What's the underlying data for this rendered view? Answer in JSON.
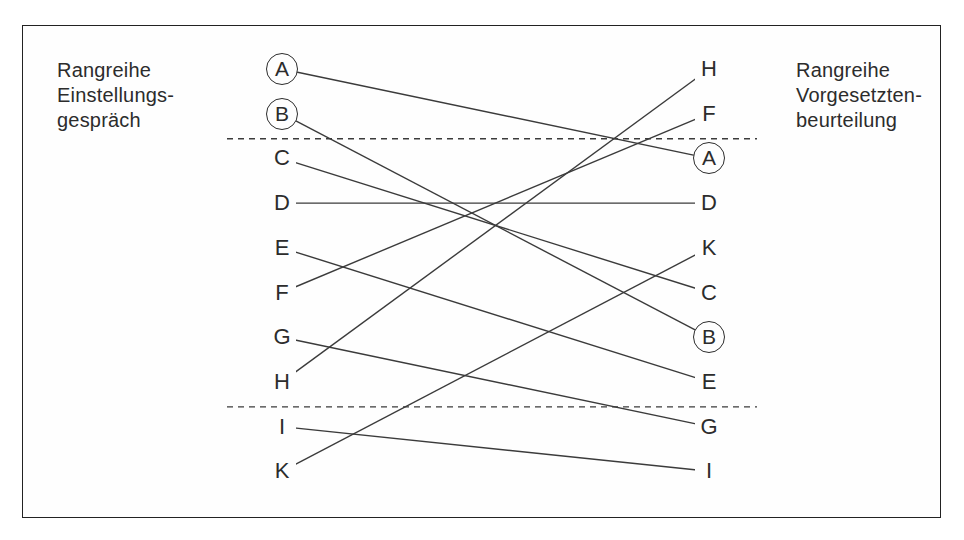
{
  "diagram": {
    "type": "rank-comparison",
    "left": {
      "title": "Rangreihe\nEinstellungs-\ngespräch",
      "order": [
        "A",
        "B",
        "C",
        "D",
        "E",
        "F",
        "G",
        "H",
        "I",
        "K"
      ],
      "circled": [
        "A",
        "B"
      ]
    },
    "right": {
      "title": "Rangreihe\nVorgesetzten-\nbeurteilung",
      "order": [
        "H",
        "F",
        "A",
        "D",
        "K",
        "C",
        "B",
        "E",
        "G",
        "I"
      ],
      "circled": [
        "A",
        "B"
      ]
    },
    "connections": [
      [
        "A",
        "A"
      ],
      [
        "B",
        "B"
      ],
      [
        "C",
        "C"
      ],
      [
        "D",
        "D"
      ],
      [
        "E",
        "E"
      ],
      [
        "F",
        "F"
      ],
      [
        "G",
        "G"
      ],
      [
        "H",
        "H"
      ],
      [
        "I",
        "I"
      ],
      [
        "K",
        "K"
      ]
    ],
    "separators_after_rank": [
      2,
      8
    ],
    "colors": {
      "line": "#3b3b3b",
      "text": "#2c2c2c",
      "frame": "#222222"
    }
  }
}
